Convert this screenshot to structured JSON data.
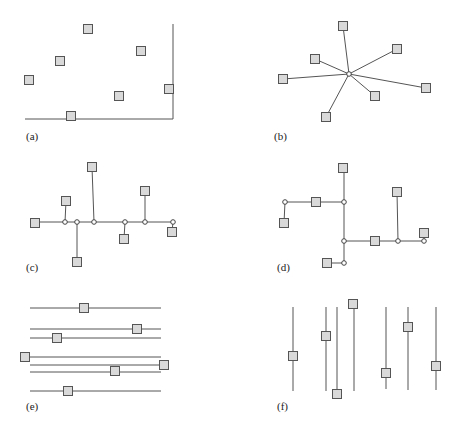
{
  "figure": {
    "square_size": 9,
    "colors": {
      "square_fill": "#d9d9d9",
      "stroke": "#555555",
      "node_fill": "#ffffff",
      "background": "#ffffff"
    },
    "panels": [
      {
        "id": "a",
        "label": "(a)",
        "label_pos": [
          26,
          140
        ],
        "lines": [
          [
            25,
            119,
            173,
            119
          ],
          [
            173,
            24,
            173,
            119
          ]
        ],
        "nodes": [],
        "squares": [
          [
            88,
            29
          ],
          [
            141,
            51
          ],
          [
            60,
            61
          ],
          [
            29,
            80
          ],
          [
            169,
            89
          ],
          [
            119,
            96
          ],
          [
            71,
            116
          ]
        ]
      },
      {
        "id": "b",
        "label": "(b)",
        "label_pos": [
          274,
          140
        ],
        "lines": [
          [
            349,
            74,
            343,
            26
          ],
          [
            349,
            74,
            397,
            49
          ],
          [
            349,
            74,
            315,
            59
          ],
          [
            349,
            74,
            283,
            79
          ],
          [
            349,
            74,
            426,
            88
          ],
          [
            349,
            74,
            375,
            96
          ],
          [
            349,
            74,
            326,
            117
          ]
        ],
        "nodes": [
          [
            349,
            74
          ]
        ],
        "squares": [
          [
            343,
            26
          ],
          [
            397,
            49
          ],
          [
            315,
            59
          ],
          [
            283,
            79
          ],
          [
            426,
            88
          ],
          [
            375,
            96
          ],
          [
            326,
            117
          ]
        ]
      },
      {
        "id": "c",
        "label": "(c)",
        "label_pos": [
          26,
          271
        ],
        "lines": [
          [
            35,
            222,
            173,
            222
          ],
          [
            65,
            222,
            66,
            201
          ],
          [
            77,
            222,
            77,
            262
          ],
          [
            94,
            222,
            92,
            167
          ],
          [
            125,
            222,
            124,
            239
          ],
          [
            145,
            222,
            145,
            191
          ],
          [
            173,
            222,
            172,
            232
          ]
        ],
        "nodes": [
          [
            65,
            222
          ],
          [
            77,
            222
          ],
          [
            94,
            222
          ],
          [
            125,
            222
          ],
          [
            145,
            222
          ],
          [
            173,
            222
          ]
        ],
        "squares": [
          [
            35,
            223
          ],
          [
            66,
            201
          ],
          [
            77,
            262
          ],
          [
            92,
            167
          ],
          [
            124,
            239
          ],
          [
            145,
            191
          ],
          [
            172,
            232
          ]
        ]
      },
      {
        "id": "d",
        "label": "(d)",
        "label_pos": [
          277,
          271
        ],
        "lines": [
          [
            285,
            202,
            344,
            202
          ],
          [
            285,
            202,
            284,
            223
          ],
          [
            344,
            168,
            344,
            263
          ],
          [
            344,
            241,
            424,
            241
          ],
          [
            398,
            241,
            397,
            192
          ],
          [
            424,
            241,
            424,
            233
          ],
          [
            327,
            263,
            344,
            263
          ]
        ],
        "nodes": [
          [
            285,
            202
          ],
          [
            344,
            202
          ],
          [
            344,
            241
          ],
          [
            398,
            241
          ],
          [
            424,
            241
          ],
          [
            344,
            263
          ]
        ],
        "squares": [
          [
            343,
            168
          ],
          [
            316,
            202
          ],
          [
            284,
            223
          ],
          [
            397,
            192
          ],
          [
            375,
            241
          ],
          [
            424,
            233
          ],
          [
            327,
            263
          ]
        ]
      },
      {
        "id": "e",
        "label": "(e)",
        "label_pos": [
          26,
          410
        ],
        "lines": [
          [
            30,
            308,
            161,
            308
          ],
          [
            30,
            329,
            161,
            329
          ],
          [
            30,
            338,
            161,
            338
          ],
          [
            30,
            357,
            161,
            357
          ],
          [
            30,
            365,
            161,
            365
          ],
          [
            30,
            372,
            161,
            372
          ],
          [
            30,
            391,
            161,
            391
          ]
        ],
        "nodes": [],
        "squares": [
          [
            84,
            308
          ],
          [
            137,
            329
          ],
          [
            57,
            338
          ],
          [
            25,
            357
          ],
          [
            164,
            365
          ],
          [
            115,
            371
          ],
          [
            68,
            391
          ]
        ]
      },
      {
        "id": "f",
        "label": "(f)",
        "label_pos": [
          277,
          410
        ],
        "lines": [
          [
            293,
            307,
            293,
            391
          ],
          [
            326,
            307,
            326,
            391
          ],
          [
            337,
            307,
            337,
            391
          ],
          [
            354,
            307,
            354,
            391
          ],
          [
            386,
            307,
            386,
            389
          ],
          [
            408,
            307,
            408,
            390
          ],
          [
            436,
            307,
            436,
            390
          ]
        ],
        "nodes": [],
        "squares": [
          [
            293,
            356
          ],
          [
            326,
            336
          ],
          [
            337,
            394
          ],
          [
            353,
            304
          ],
          [
            386,
            373
          ],
          [
            408,
            327
          ],
          [
            436,
            366
          ]
        ]
      }
    ]
  }
}
